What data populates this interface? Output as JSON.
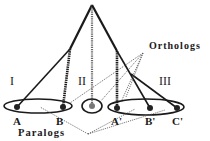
{
  "diagram": {
    "groups": [
      {
        "id": "I",
        "label": "I",
        "genes": [
          "A",
          "B"
        ]
      },
      {
        "id": "II",
        "label": "II",
        "genes": []
      },
      {
        "id": "III",
        "label": "III",
        "genes": [
          "A'",
          "B'",
          "C'"
        ]
      }
    ],
    "leaves": {
      "A": "A",
      "B": "B",
      "A2": "A'",
      "B2": "B'",
      "C2": "C'"
    },
    "annotations": {
      "orthologs": "Orthologs",
      "paralogs": "Paralogs"
    },
    "colors": {
      "line": "#1a1a1a",
      "dotted": "#555555",
      "node": "#222222",
      "center_node": "#777777"
    }
  }
}
